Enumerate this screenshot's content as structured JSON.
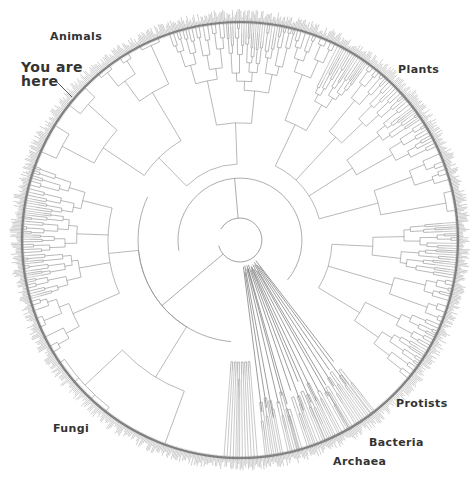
{
  "diagram": {
    "type": "circular-phylogenetic-tree",
    "center": [
      240,
      240
    ],
    "outer_radius": 222,
    "inner_ring_radius": 22,
    "middle_ring_radius": 62,
    "colors": {
      "branch": "#8a8a8a",
      "branch_dark": "#5a5a5a",
      "fringe": "#9a9a9a",
      "label": "#333333",
      "background": "#ffffff"
    }
  },
  "labels": {
    "animals": "Animals",
    "you_are_here_line1": "You are",
    "you_are_here_line2": "here",
    "plants": "Plants",
    "protists": "Protists",
    "bacteria": "Bacteria",
    "archaea": "Archaea",
    "fungi": "Fungi"
  },
  "clades": [
    {
      "name": "Animals",
      "start_deg": 200,
      "end_deg": 285
    },
    {
      "name": "Plants",
      "start_deg": 285,
      "end_deg": 355
    },
    {
      "name": "Protists",
      "start_deg": 355,
      "end_deg": 40
    },
    {
      "name": "Bacteria",
      "start_deg": 40,
      "end_deg": 70
    },
    {
      "name": "Archaea",
      "start_deg": 70,
      "end_deg": 85
    },
    {
      "name": "Fungi",
      "start_deg": 85,
      "end_deg": 200
    }
  ]
}
